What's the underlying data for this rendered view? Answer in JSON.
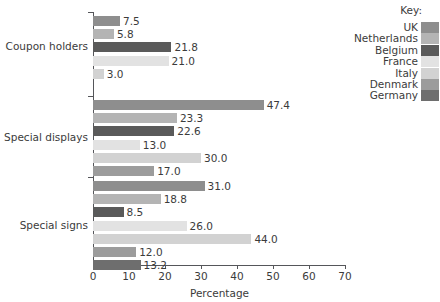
{
  "legend": {
    "title": "Key:",
    "position": "top-right",
    "entries": [
      {
        "label": "UK",
        "color": "#8e8e8e"
      },
      {
        "label": "Netherlands",
        "color": "#b4b4b4"
      },
      {
        "label": "Belgium",
        "color": "#5a5a5a"
      },
      {
        "label": "France",
        "color": "#e2e2e2"
      },
      {
        "label": "Italy",
        "color": "#d2d2d2"
      },
      {
        "label": "Denmark",
        "color": "#9c9c9c"
      },
      {
        "label": "Germany",
        "color": "#6e6e6e"
      }
    ]
  },
  "axis": {
    "x_title": "Percentage",
    "x_ticks": [
      "0",
      "10",
      "20",
      "30",
      "40",
      "50",
      "60",
      "70"
    ],
    "x_min": 0,
    "x_max": 70
  },
  "chart_data": {
    "type": "bar",
    "orientation": "horizontal",
    "title": "",
    "xlabel": "Percentage",
    "ylabel": "",
    "xlim": [
      0,
      70
    ],
    "grid": false,
    "legend_title": "Key:",
    "legend_position": "top-right",
    "categories": [
      "Coupon holders",
      "Special displays",
      "Special signs"
    ],
    "series": [
      {
        "name": "UK",
        "color": "#8e8e8e",
        "values": [
          7.5,
          47.4,
          31.0
        ]
      },
      {
        "name": "Netherlands",
        "color": "#b4b4b4",
        "values": [
          5.8,
          23.3,
          18.8
        ]
      },
      {
        "name": "Belgium",
        "color": "#5a5a5a",
        "values": [
          21.8,
          22.6,
          8.5
        ]
      },
      {
        "name": "France",
        "color": "#e2e2e2",
        "values": [
          21.0,
          13.0,
          26.0
        ]
      },
      {
        "name": "Italy",
        "color": "#d2d2d2",
        "values": [
          3.0,
          30.0,
          44.0
        ]
      },
      {
        "name": "Denmark",
        "color": "#9c9c9c",
        "values": [
          null,
          17.0,
          12.0
        ]
      },
      {
        "name": "Germany",
        "color": "#6e6e6e",
        "values": [
          null,
          null,
          13.2
        ]
      }
    ],
    "groups": [
      {
        "label": "Coupon holders",
        "bars": [
          {
            "series": "UK",
            "value": 7.5,
            "label": "7.5",
            "color": "#8e8e8e"
          },
          {
            "series": "Netherlands",
            "value": 5.8,
            "label": "5.8",
            "color": "#b4b4b4"
          },
          {
            "series": "Belgium",
            "value": 21.8,
            "label": "21.8",
            "color": "#5a5a5a"
          },
          {
            "series": "France",
            "value": 21.0,
            "label": "21.0",
            "color": "#e2e2e2"
          },
          {
            "series": "Italy",
            "value": 3.0,
            "label": "3.0",
            "color": "#d2d2d2"
          }
        ]
      },
      {
        "label": "Special displays",
        "bars": [
          {
            "series": "UK",
            "value": 47.4,
            "label": "47.4",
            "color": "#8e8e8e"
          },
          {
            "series": "Netherlands",
            "value": 23.3,
            "label": "23.3",
            "color": "#b4b4b4"
          },
          {
            "series": "Belgium",
            "value": 22.6,
            "label": "22.6",
            "color": "#5a5a5a"
          },
          {
            "series": "France",
            "value": 13.0,
            "label": "13.0",
            "color": "#e2e2e2"
          },
          {
            "series": "Italy",
            "value": 30.0,
            "label": "30.0",
            "color": "#d2d2d2"
          },
          {
            "series": "Denmark",
            "value": 17.0,
            "label": "17.0",
            "color": "#9c9c9c"
          }
        ]
      },
      {
        "label": "Special signs",
        "bars": [
          {
            "series": "UK",
            "value": 31.0,
            "label": "31.0",
            "color": "#8e8e8e"
          },
          {
            "series": "Netherlands",
            "value": 18.8,
            "label": "18.8",
            "color": "#b4b4b4"
          },
          {
            "series": "Belgium",
            "value": 8.5,
            "label": "8.5",
            "color": "#5a5a5a"
          },
          {
            "series": "France",
            "value": 26.0,
            "label": "26.0",
            "color": "#e2e2e2"
          },
          {
            "series": "Italy",
            "value": 44.0,
            "label": "44.0",
            "color": "#d2d2d2"
          },
          {
            "series": "Denmark",
            "value": 12.0,
            "label": "12.0",
            "color": "#9c9c9c"
          },
          {
            "series": "Germany",
            "value": 13.2,
            "label": "13.2",
            "color": "#6e6e6e"
          }
        ]
      }
    ]
  }
}
